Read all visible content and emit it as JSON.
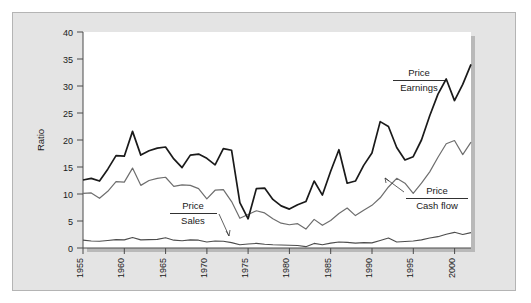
{
  "chart_data": {
    "type": "line",
    "title": "",
    "xlabel": "",
    "ylabel": "Ratio",
    "xlim": [
      1955,
      2002
    ],
    "ylim": [
      0,
      40
    ],
    "yticks": [
      0,
      5,
      10,
      15,
      20,
      25,
      30,
      35,
      40
    ],
    "xticks": [
      1955,
      1960,
      1965,
      1970,
      1975,
      1980,
      1985,
      1990,
      1995,
      2000
    ],
    "xtick_labels": [
      "1955",
      "1960",
      "1965",
      "1970",
      "1975",
      "1980",
      "1985",
      "1990",
      "1995",
      "2000"
    ],
    "ytick_labels": [
      "0",
      "5",
      "10",
      "15",
      "20",
      "25",
      "30",
      "35",
      "40"
    ],
    "grid": false,
    "legend_position": "inline-annotations",
    "x": [
      1955,
      1956,
      1957,
      1958,
      1959,
      1960,
      1961,
      1962,
      1963,
      1964,
      1965,
      1966,
      1967,
      1968,
      1969,
      1970,
      1971,
      1972,
      1973,
      1974,
      1975,
      1976,
      1977,
      1978,
      1979,
      1980,
      1981,
      1982,
      1983,
      1984,
      1985,
      1986,
      1987,
      1988,
      1989,
      1990,
      1991,
      1992,
      1993,
      1994,
      1995,
      1996,
      1997,
      1998,
      1999,
      2000,
      2001,
      2002
    ],
    "series": [
      {
        "name": "Price / Earnings",
        "color": "#1a1a1a",
        "values": [
          12.6,
          12.9,
          12.4,
          14.6,
          17.1,
          17.0,
          21.6,
          17.2,
          18.0,
          18.5,
          18.7,
          16.5,
          14.9,
          17.2,
          17.4,
          16.6,
          15.4,
          18.4,
          18.1,
          8.4,
          5.4,
          11.0,
          11.1,
          9.0,
          7.8,
          7.2,
          8.0,
          8.6,
          12.4,
          9.8,
          14.2,
          18.2,
          12.0,
          12.4,
          15.3,
          17.6,
          23.4,
          22.5,
          18.6,
          16.3,
          16.9,
          20.0,
          24.5,
          28.5,
          31.3,
          27.3,
          30.3,
          34.0
        ]
      },
      {
        "name": "Price / Cash flow",
        "color": "#6e6e6e",
        "values": [
          10.1,
          10.2,
          9.2,
          10.5,
          12.3,
          12.2,
          14.8,
          11.6,
          12.5,
          12.9,
          13.1,
          11.4,
          11.7,
          11.6,
          11.0,
          9.1,
          10.7,
          10.8,
          8.6,
          5.5,
          6.2,
          6.9,
          6.5,
          5.4,
          4.6,
          4.3,
          4.5,
          3.5,
          5.3,
          4.2,
          5.1,
          6.4,
          7.4,
          6.0,
          7.0,
          7.9,
          9.3,
          11.3,
          12.9,
          12.0,
          10.1,
          12.0,
          14.1,
          16.8,
          19.3,
          19.9,
          17.3,
          19.6
        ]
      },
      {
        "name": "Price / Sales",
        "color": "#4d4d4d",
        "values": [
          1.45,
          1.3,
          1.25,
          1.4,
          1.55,
          1.5,
          1.95,
          1.5,
          1.55,
          1.6,
          1.9,
          1.45,
          1.35,
          1.5,
          1.45,
          1.1,
          1.3,
          1.25,
          1.0,
          0.6,
          0.75,
          0.85,
          0.7,
          0.6,
          0.55,
          0.5,
          0.45,
          0.25,
          0.85,
          0.6,
          0.9,
          1.1,
          1.05,
          0.9,
          1.0,
          0.95,
          1.4,
          1.85,
          1.1,
          1.2,
          1.3,
          1.5,
          1.85,
          2.1,
          2.55,
          2.9,
          2.5,
          2.85
        ]
      }
    ],
    "annotations": [
      {
        "name": "price-earnings-label",
        "numerator": "Price",
        "denominator": "Earnings",
        "x": 394,
        "y": 75
      },
      {
        "name": "price-cashflow-label",
        "numerator": "Price",
        "denominator": "Cash flow",
        "x": 412,
        "y": 193
      },
      {
        "name": "price-sales-label",
        "numerator": "Price",
        "denominator": "Sales",
        "x": 171,
        "y": 207
      }
    ]
  }
}
